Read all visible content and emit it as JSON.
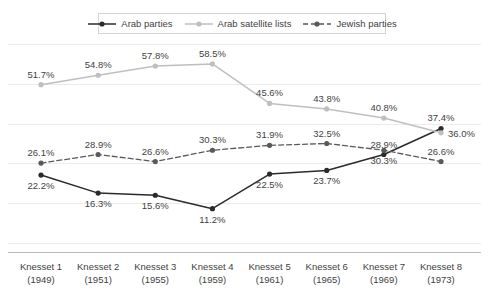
{
  "chart_data": {
    "type": "line",
    "title": "",
    "subtitle": "",
    "xlabel": "",
    "ylabel": "",
    "ylim": [
      0,
      65
    ],
    "grid": true,
    "legend_position": "top-center",
    "categories": [
      "Knesset 1",
      "Knesset 2",
      "Knesset 3",
      "Knesset 4",
      "Knesset 5",
      "Knesset 6",
      "Knesset 7",
      "Knesset 8"
    ],
    "category_years": [
      "(1949)",
      "(1951)",
      "(1955)",
      "(1959)",
      "(1961)",
      "(1965)",
      "(1969)",
      "(1973)"
    ],
    "series": [
      {
        "name": "Arab parties",
        "color": "#2b2b2b",
        "dash": "none",
        "values": [
          22.2,
          16.3,
          15.6,
          11.2,
          22.5,
          23.7,
          28.9,
          37.4
        ],
        "labels": [
          "22.2%",
          "16.3%",
          "15.6%",
          "11.2%",
          "22.5%",
          "23.7%",
          "28.9%",
          "37.4%"
        ],
        "label_pos": [
          "below",
          "below",
          "below",
          "below",
          "below",
          "below",
          "above",
          "above"
        ]
      },
      {
        "name": "Arab satellite lists",
        "color": "#bfbfbf",
        "dash": "none",
        "values": [
          51.7,
          54.8,
          57.8,
          58.5,
          45.6,
          43.8,
          40.8,
          36.0
        ],
        "labels": [
          "51.7%",
          "54.8%",
          "57.8%",
          "58.5%",
          "45.6%",
          "43.8%",
          "40.8%",
          "36.0%"
        ],
        "label_pos": [
          "above",
          "above",
          "above",
          "above",
          "above",
          "above",
          "above",
          "right"
        ]
      },
      {
        "name": "Jewish parties",
        "color": "#595959",
        "dash": "dashed",
        "values": [
          26.1,
          28.9,
          26.6,
          30.3,
          31.9,
          32.5,
          30.3,
          26.6
        ],
        "labels": [
          "26.1%",
          "28.9%",
          "26.6%",
          "30.3%",
          "31.9%",
          "32.5%",
          "30.3%",
          "26.6%"
        ],
        "label_pos": [
          "above",
          "above",
          "above",
          "above",
          "above",
          "above",
          "below",
          "above"
        ]
      }
    ]
  },
  "legend": {
    "items": [
      {
        "label": "Arab parties",
        "color": "#2b2b2b",
        "dash": "none"
      },
      {
        "label": "Arab satellite lists",
        "color": "#bfbfbf",
        "dash": "none"
      },
      {
        "label": "Jewish parties",
        "color": "#595959",
        "dash": "dashed"
      }
    ]
  }
}
